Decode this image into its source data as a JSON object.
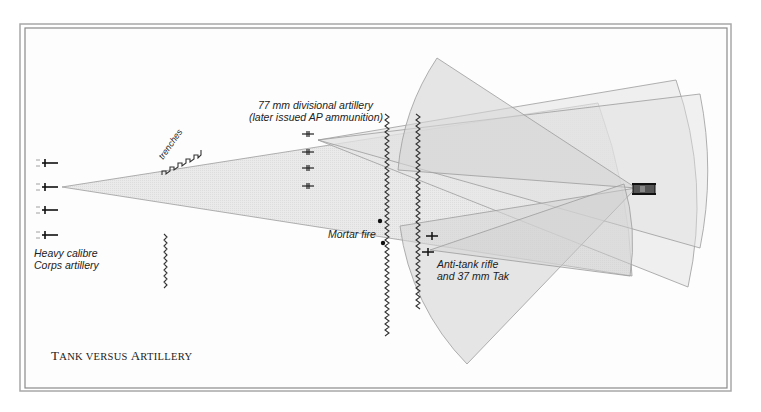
{
  "title": {
    "word1_cap": "T",
    "word1_rest": "ANK VERSUS ",
    "word2_cap": "A",
    "word2_rest": "RTILLERY",
    "full": "Tank versus Artillery"
  },
  "labels": {
    "divisional_artillery_line1": "77 mm divisional artillery",
    "divisional_artillery_line2": "(later issued AP ammunition)",
    "trenches": "trenches",
    "heavy_artillery_line1": "Heavy calibre",
    "heavy_artillery_line2": "Corps artillery",
    "mortar_fire": "Mortar fire",
    "anti_tank_line1": "Anti-tank rifle",
    "anti_tank_line2": "and 37 mm Tak"
  },
  "icons": {
    "heavy_gun": "field-gun-icon",
    "divisional_gun": "field-gun-icon",
    "tank": "tank-icon",
    "mortar": "mortar-position-icon",
    "trench": "trench-line-icon",
    "anti_tank": "anti-tank-gun-icon"
  },
  "colors": {
    "frame": "#9a9a9a",
    "wedge_fill": "#d9d9d9",
    "wedge_stroke": "#9c9c9c",
    "ink": "#222222"
  }
}
